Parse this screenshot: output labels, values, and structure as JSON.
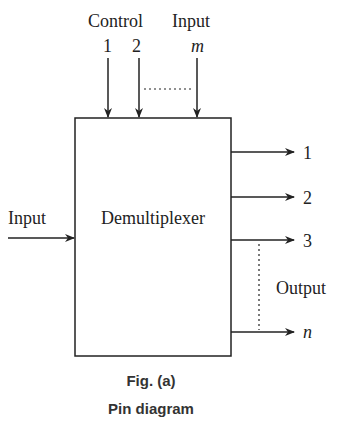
{
  "diagram": {
    "block_label": "Demultiplexer",
    "control": {
      "label_left": "Control",
      "label_right": "Input",
      "pins": [
        "1",
        "2",
        "m"
      ]
    },
    "input": {
      "label": "Input"
    },
    "outputs": {
      "label": "Output",
      "pins": [
        "1",
        "2",
        "3",
        "n"
      ]
    },
    "caption": {
      "figure": "Fig. (a)",
      "title": "Pin diagram"
    },
    "colors": {
      "line": "#222222",
      "text": "#222222",
      "caption": "#333333",
      "background": "#ffffff"
    }
  }
}
